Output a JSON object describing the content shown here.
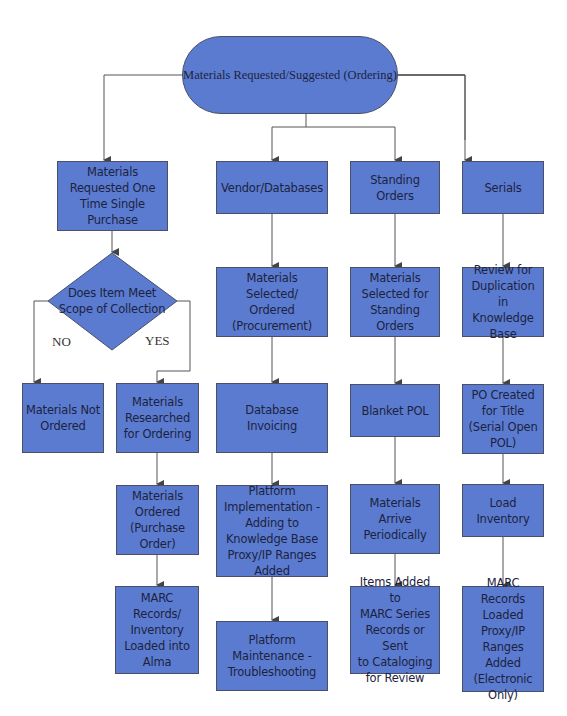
{
  "diagram": {
    "root": {
      "label": "Materials Requested/Suggested (Ordering)"
    },
    "decision": {
      "label": "Does Item Meet\nScope of Collection",
      "no_label": "NO",
      "yes_label": "YES"
    },
    "columns": {
      "one_time": {
        "head": "Materials\nRequested One\nTime Single\nPurchase",
        "no_branch": "Materials Not\nOrdered",
        "yes_steps": [
          "Materials\nResearched\nfor Ordering",
          "Materials\nOrdered\n(Purchase\nOrder)",
          "MARC\nRecords/\nInventory\nLoaded into\nAlma"
        ]
      },
      "vendor": {
        "head": "Vendor/Databases",
        "steps": [
          "Materials Selected/\nOrdered\n(Procurement)",
          "Database Invoicing",
          "Platform\nImplementation -\nAdding to\nKnowledge Base\nProxy/IP Ranges\nAdded",
          "Platform\nMaintenance -\nTroubleshooting"
        ]
      },
      "standing": {
        "head": "Standing\nOrders",
        "steps": [
          "Materials\nSelected for\nStanding\nOrders",
          "Blanket POL",
          "Materials\nArrive\nPeriodically",
          "Items Added to\nMARC Series\nRecords or Sent\nto Cataloging\nfor Review"
        ]
      },
      "serials": {
        "head": "Serials",
        "steps": [
          "Review for\nDuplication in\nKnowledge\nBase",
          "PO Created\nfor Title\n(Serial Open\nPOL)",
          "Load\nInventory",
          "MARC Records\nLoaded\nProxy/IP\nRanges Added\n(Electronic\nOnly)"
        ]
      }
    },
    "colors": {
      "node_fill": "#5b7bd0",
      "node_border": "#4a4f66",
      "connector": "#555555"
    }
  }
}
